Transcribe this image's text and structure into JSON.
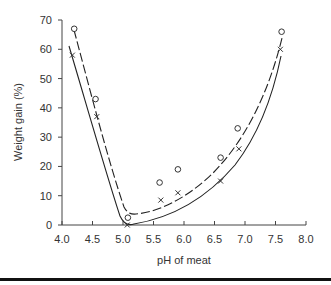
{
  "chart_data": {
    "type": "scatter",
    "title": "",
    "xlabel": "pH of meat",
    "ylabel": "Weight gain (%)",
    "xlim": [
      4.0,
      8.0
    ],
    "ylim": [
      0,
      70
    ],
    "x_ticks": [
      "4.0",
      "4.5",
      "5.0",
      "5.5",
      "6.0",
      "6.5",
      "7.0",
      "7.5",
      "8.0"
    ],
    "y_ticks": [
      "0",
      "10",
      "20",
      "30",
      "40",
      "50",
      "60",
      "70"
    ],
    "grid": false,
    "legend": null,
    "series": [
      {
        "name": "o (circles, dashed fit curve)",
        "marker": "circle",
        "line_style": "dashed",
        "points": [
          {
            "x": 4.2,
            "y": 67
          },
          {
            "x": 4.55,
            "y": 43
          },
          {
            "x": 5.08,
            "y": 2.5
          },
          {
            "x": 5.6,
            "y": 14.5
          },
          {
            "x": 5.9,
            "y": 19
          },
          {
            "x": 6.6,
            "y": 23
          },
          {
            "x": 6.88,
            "y": 33
          },
          {
            "x": 7.6,
            "y": 66
          }
        ]
      },
      {
        "name": "x (crosses, solid fit curve)",
        "marker": "x",
        "line_style": "solid",
        "points": [
          {
            "x": 4.17,
            "y": 58
          },
          {
            "x": 4.57,
            "y": 37
          },
          {
            "x": 5.07,
            "y": 0
          },
          {
            "x": 5.62,
            "y": 8.5
          },
          {
            "x": 5.9,
            "y": 11
          },
          {
            "x": 6.6,
            "y": 15
          },
          {
            "x": 6.9,
            "y": 26
          },
          {
            "x": 7.58,
            "y": 60
          }
        ]
      }
    ]
  }
}
